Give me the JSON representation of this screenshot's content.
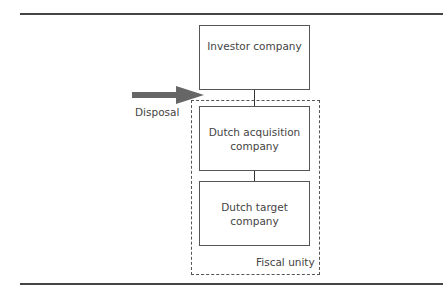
{
  "diagram": {
    "nodes": [
      {
        "id": "investor",
        "label": "Investor company"
      },
      {
        "id": "acquisition",
        "label": "Dutch acquisition company"
      },
      {
        "id": "target",
        "label": "Dutch target company"
      }
    ],
    "edges": [
      {
        "from": "investor",
        "to": "acquisition"
      },
      {
        "from": "acquisition",
        "to": "target"
      }
    ],
    "group": {
      "label": "Fiscal unity",
      "members": [
        "acquisition",
        "target"
      ]
    },
    "arrow": {
      "label": "Disposal",
      "points_to": "fiscal-unity-boundary",
      "color": "#666666"
    }
  }
}
